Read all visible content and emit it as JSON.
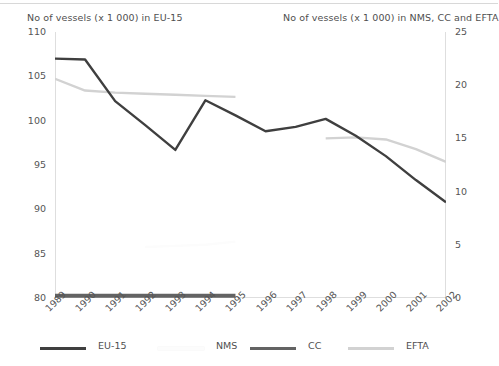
{
  "titles": {
    "left_axis_title": "No of vessels (x 1 000) in EU-15",
    "right_axis_title": "No of vessels (x 1 000) in NMS, CC and EFTA"
  },
  "colors": {
    "eu15": "#3f3f3f",
    "nms": "#fcfcfc",
    "cc": "#636363",
    "efta": "#d2d2d2",
    "axis": "#bdbdbd",
    "text": "#4f4f4f",
    "background": "#ffffff"
  },
  "legend": {
    "position": "bottom",
    "items": [
      {
        "label": "EU-15",
        "color": "#3f3f3f"
      },
      {
        "label": "NMS",
        "color": "#fcfcfc"
      },
      {
        "label": "CC",
        "color": "#636363"
      },
      {
        "label": "EFTA",
        "color": "#d2d2d2"
      }
    ]
  },
  "axes": {
    "left": {
      "label": "No of vessels (x 1 000) in EU-15",
      "min": 80,
      "max": 110,
      "step": 5,
      "ticks": [
        "80",
        "85",
        "90",
        "95",
        "100",
        "105",
        "110"
      ]
    },
    "right": {
      "label": "No of vessels (x 1 000) in NMS, CC and EFTA",
      "min": 0,
      "max": 25,
      "step": 5,
      "ticks": [
        "0",
        "5",
        "10",
        "15",
        "20",
        "25"
      ]
    },
    "x": {
      "ticks": [
        "1989",
        "1990",
        "1991",
        "1992",
        "1993",
        "1994",
        "1995",
        "1996",
        "1997",
        "1998",
        "1999",
        "2000",
        "2001",
        "2002"
      ],
      "rotation": -45
    }
  },
  "chart_data": {
    "type": "line",
    "title": "",
    "xlabel": "",
    "ylabel": "No of vessels (x 1 000) in EU-15",
    "y2label": "No of vessels (x 1 000) in NMS, CC and EFTA",
    "ylim": [
      80,
      110
    ],
    "y2lim": [
      0,
      25
    ],
    "grid": false,
    "legend_position": "bottom",
    "categories": [
      "1989",
      "1990",
      "1991",
      "1992",
      "1993",
      "1994",
      "1995",
      "1996",
      "1997",
      "1998",
      "1999",
      "2000",
      "2001",
      "2002"
    ],
    "series": [
      {
        "name": "EU-15",
        "axis": "left",
        "color": "#3f3f3f",
        "values": [
          107.0,
          106.9,
          102.2,
          99.5,
          96.7,
          102.3,
          100.6,
          98.8,
          99.3,
          100.2,
          98.3,
          96.0,
          93.3,
          90.8
        ]
      },
      {
        "name": "EFTA",
        "axis": "right",
        "color": "#d2d2d2",
        "values": [
          20.6,
          19.5,
          19.3,
          19.2,
          19.1,
          19.0,
          18.9,
          null,
          null,
          15.0,
          15.1,
          14.9,
          14.0,
          12.8
        ]
      },
      {
        "name": "CC",
        "axis": "right",
        "color": "#636363",
        "values": [
          0.2,
          0.2,
          0.2,
          0.2,
          0.2,
          0.2,
          0.2,
          null,
          null,
          null,
          null,
          null,
          null,
          null
        ]
      },
      {
        "name": "NMS",
        "axis": "right",
        "color": "#fcfcfc",
        "values": [
          null,
          null,
          null,
          4.8,
          4.9,
          5.0,
          5.3,
          null,
          null,
          null,
          null,
          null,
          null,
          null
        ]
      }
    ]
  }
}
